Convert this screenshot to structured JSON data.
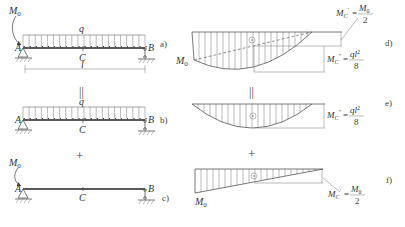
{
  "figure": {
    "panels": {
      "a": {
        "label": "a)",
        "moment": "M",
        "moment_sub": "0",
        "load": "q",
        "left_support": "A",
        "right_support": "B",
        "mid_point": "C",
        "span": "l"
      },
      "b": {
        "label": "b)",
        "load": "q",
        "left_support": "A",
        "right_support": "B",
        "mid_point": "C"
      },
      "c": {
        "label": "c)",
        "moment": "M",
        "moment_sub": "0",
        "left_support": "A",
        "right_support": "B",
        "mid_point": "C"
      },
      "d": {
        "label": "d)",
        "end_moment": "M",
        "end_moment_sub": "0",
        "ann1": {
          "lhs": "M",
          "sub": "C",
          "prime": "′",
          "eq": "=",
          "num": "M",
          "num_sub": "0",
          "den": "2"
        },
        "ann2": {
          "lhs": "M",
          "sub": "C",
          "prime": "″",
          "eq": "=",
          "num": "ql",
          "num_sup": "2",
          "den": "8"
        }
      },
      "e": {
        "label": "e)",
        "ann": {
          "lhs": "M",
          "sub": "C",
          "prime": "″",
          "eq": "=",
          "num": "ql",
          "num_sup": "2",
          "den": "8"
        }
      },
      "f": {
        "label": "f)",
        "end_moment": "M",
        "end_moment_sub": "0",
        "ann": {
          "lhs": "M",
          "sub": "C",
          "prime": "′",
          "eq": "=",
          "num": "M",
          "num_sub": "0",
          "den": "2"
        }
      }
    },
    "operators": {
      "equals": "||",
      "plus": "+"
    }
  }
}
